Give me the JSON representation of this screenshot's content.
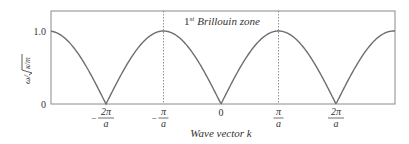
{
  "chart_data": {
    "type": "line",
    "title": "",
    "annotation": {
      "sup_prefix": "1",
      "sup": "st",
      "text": "Brillouin zone"
    },
    "xlabel": "Wave vector k",
    "ylabel": "ω/√(κ/m)",
    "ylabel_parts": {
      "num": "ω/",
      "rad": "κ/m"
    },
    "x_units": "π/a",
    "xlim": [
      -2.96,
      3.0
    ],
    "ylim": [
      0,
      1.0
    ],
    "y_ticks": [
      {
        "value": 0,
        "label": "0"
      },
      {
        "value": 1.0,
        "label": "1.0"
      }
    ],
    "x_ticks": [
      {
        "value": -2,
        "sign": "−",
        "num": "2π",
        "den": "a"
      },
      {
        "value": -1,
        "sign": "−",
        "num": "π",
        "den": "a"
      },
      {
        "value": 0,
        "label": "0"
      },
      {
        "value": 1,
        "sign": "",
        "num": "π",
        "den": "a"
      },
      {
        "value": 2,
        "sign": "",
        "num": "2π",
        "den": "a"
      }
    ],
    "zone_boundaries": [
      -1,
      1
    ],
    "series": [
      {
        "name": "dispersion |sin(ka/2)|",
        "function": "abs(sin(pi*k/2))",
        "x": [
          -3,
          -2.5,
          -2,
          -1.5,
          -1,
          -0.5,
          0,
          0.5,
          1,
          1.5,
          2,
          2.5,
          3
        ],
        "values": [
          1.0,
          0.71,
          0,
          0.71,
          1.0,
          0.71,
          0,
          0.71,
          1.0,
          0.71,
          0,
          0.71,
          1.0
        ]
      }
    ],
    "grid": false,
    "legend": null,
    "colors": {
      "curve": "#6e6e6e",
      "frame": "#8a8a8a",
      "text": "#333333"
    }
  }
}
